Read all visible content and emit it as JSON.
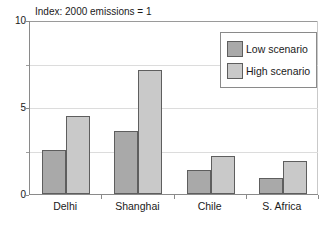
{
  "chart_data": {
    "type": "bar",
    "title": "",
    "note": "Index: 2000 emissions = 1",
    "xlabel": "",
    "ylabel": "",
    "ylim": [
      0,
      10
    ],
    "y_ticks": [
      0,
      5,
      10
    ],
    "y_tick_labels": [
      "0",
      "5",
      "10"
    ],
    "y_minor_ticks": [
      2.5,
      7.5
    ],
    "grid": true,
    "gridlines": [
      2.5,
      5,
      7.5
    ],
    "legend_position": "top-right",
    "categories": [
      "Delhi",
      "Shanghai",
      "Chile",
      "S. Africa"
    ],
    "series": [
      {
        "name": "Low scenario",
        "color": "#a9a9a9",
        "values": [
          2.5,
          3.6,
          1.4,
          0.9
        ]
      },
      {
        "name": "High scenario",
        "color": "#c9c9c9",
        "values": [
          4.5,
          7.1,
          2.2,
          1.9
        ]
      }
    ]
  },
  "colors": {
    "low": "#a9a9a9",
    "high": "#c9c9c9",
    "bar_border": "#5e5e5e",
    "axis": "#8a8a8a",
    "grid": "#dcdcdc",
    "text": "#1a1a1a",
    "background": "#ffffff"
  }
}
